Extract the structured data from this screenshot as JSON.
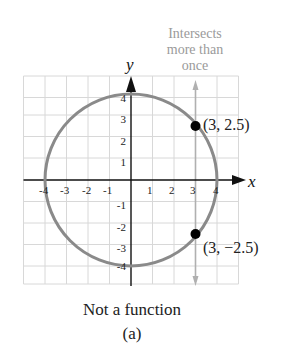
{
  "figure": {
    "caption": "Not a function",
    "label": "(a)",
    "annotation": "Intersects more than once",
    "annotation_lines": [
      "Intersects",
      "more than",
      "once"
    ],
    "x_axis_label": "x",
    "y_axis_label": "y",
    "x_ticks": [
      "-4",
      "-3",
      "-2",
      "-1",
      "1",
      "2",
      "3",
      "4"
    ],
    "y_ticks": [
      "4",
      "3",
      "2",
      "1",
      "-1",
      "-2",
      "-3",
      "-4"
    ],
    "points": [
      {
        "label": "(3, 2.5)",
        "x": 3,
        "y": 2.5
      },
      {
        "label": "(3, −2.5)",
        "x": 3,
        "y": -2.5
      }
    ],
    "curve": "circle x^2 + y^2 = 16",
    "vertical_line": "x = 3",
    "colors": {
      "curve": "#8a8a8a",
      "grid": "#d6d6d6",
      "axes": "#111111",
      "vertical_line": "#b0b0b0",
      "annotation_text": "#9a9a9a",
      "points": "#000000"
    }
  }
}
